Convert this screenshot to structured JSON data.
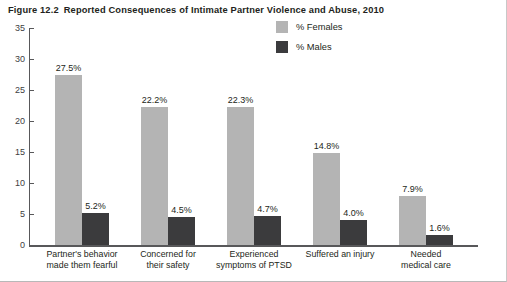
{
  "figure": {
    "number": "Figure 12.2",
    "title": "Reported Consequences of Intimate Partner Violence and Abuse, 2010"
  },
  "legend": {
    "females_label": "% Females",
    "females_color": "#b4b4b4",
    "males_label": "% Males",
    "males_color": "#3b3b3d"
  },
  "chart_data": {
    "type": "bar",
    "title": "Reported Consequences of Intimate Partner Violence and Abuse, 2010",
    "xlabel": "",
    "ylabel": "",
    "ylim": [
      0,
      35
    ],
    "yticks": [
      0,
      5,
      10,
      15,
      20,
      25,
      30,
      35
    ],
    "ytick_labels": [
      "0",
      "5",
      "10",
      "15",
      "20",
      "25",
      "30",
      "35"
    ],
    "grid": false,
    "legend_position": "top-center-right",
    "categories": [
      "Partner's behavior made them fearful",
      "Concerned for their safety",
      "Experienced symptoms of PTSD",
      "Suffered an injury",
      "Needed medical care"
    ],
    "category_lines": [
      [
        "Partner's behavior",
        "made them fearful"
      ],
      [
        "Concerned for",
        "their safety"
      ],
      [
        "Experienced",
        "symptoms of PTSD"
      ],
      [
        "Suffered an injury",
        ""
      ],
      [
        "Needed",
        "medical care"
      ]
    ],
    "series": [
      {
        "name": "% Females",
        "color": "#b4b4b4",
        "values": [
          27.5,
          22.2,
          22.3,
          14.8,
          7.9
        ],
        "data_labels": [
          "27.5%",
          "22.2%",
          "22.3%",
          "14.8%",
          "7.9%"
        ]
      },
      {
        "name": "% Males",
        "color": "#3b3b3d",
        "values": [
          5.2,
          4.5,
          4.7,
          4.0,
          1.6
        ],
        "data_labels": [
          "5.2%",
          "4.5%",
          "4.7%",
          "4.0%",
          "1.6%"
        ]
      }
    ]
  }
}
